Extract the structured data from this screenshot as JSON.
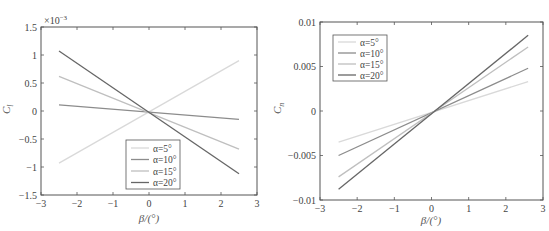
{
  "chart_data": [
    {
      "type": "line",
      "title": "",
      "xlabel": "β/(°)",
      "ylabel": "C_l",
      "y_multiplier_label": "×10⁻³",
      "xlim": [
        -3,
        3
      ],
      "ylim": [
        -1.5,
        1.5
      ],
      "xticks": [
        "-3",
        "-2",
        "-1",
        "0",
        "1",
        "2",
        "3"
      ],
      "yticks": [
        "-1.5",
        "-1",
        "-0.5",
        "0",
        "0.5",
        "1",
        "1.5"
      ],
      "grid": false,
      "legend_position": "lower center",
      "x": [
        -2.5,
        2.5
      ],
      "series": [
        {
          "name": "α=5°",
          "color": "#d9d9d9",
          "values": [
            -0.93,
            0.9
          ]
        },
        {
          "name": "α=10°",
          "color": "#8c8c8c",
          "values": [
            0.11,
            -0.15
          ]
        },
        {
          "name": "α=15°",
          "color": "#bfbfbf",
          "values": [
            0.62,
            -0.68
          ]
        },
        {
          "name": "α=20°",
          "color": "#666666",
          "values": [
            1.07,
            -1.12
          ]
        }
      ],
      "units_note": "values in units of 10^-3"
    },
    {
      "type": "line",
      "title": "",
      "xlabel": "β/(°)",
      "ylabel": "C_n",
      "xlim": [
        -3,
        3
      ],
      "ylim": [
        -0.01,
        0.01
      ],
      "xticks": [
        "-3",
        "-2",
        "-1",
        "0",
        "1",
        "2",
        "3"
      ],
      "yticks": [
        "-0.01",
        "-0.005",
        "0",
        "0.005",
        "0.01"
      ],
      "grid": false,
      "legend_position": "upper left",
      "x": [
        -2.5,
        2.6
      ],
      "series": [
        {
          "name": "α=5°",
          "color": "#d9d9d9",
          "values": [
            -0.0035,
            0.0033
          ]
        },
        {
          "name": "α=10°",
          "color": "#8c8c8c",
          "values": [
            -0.005,
            0.0048
          ]
        },
        {
          "name": "α=15°",
          "color": "#bfbfbf",
          "values": [
            -0.0074,
            0.0072
          ]
        },
        {
          "name": "α=20°",
          "color": "#666666",
          "values": [
            -0.0088,
            0.0085
          ]
        }
      ]
    }
  ],
  "left": {
    "ylabel": "C",
    "ylabel_sub": "l",
    "multiplier": "×10",
    "multiplier_exp": "−3",
    "xlabel": "β/(°)",
    "xticks": [
      "−3",
      "−2",
      "−1",
      "0",
      "1",
      "2",
      "3"
    ],
    "yticks": [
      "−1.5",
      "−1",
      "−0.5",
      "0",
      "0.5",
      "1",
      "1.5"
    ],
    "legend": [
      "α=5°",
      "α=10°",
      "α=15°",
      "α=20°"
    ]
  },
  "right": {
    "ylabel": "C",
    "ylabel_sub": "n",
    "xlabel": "β/(°)",
    "xticks": [
      "−3",
      "−2",
      "−1",
      "0",
      "1",
      "2",
      "3"
    ],
    "yticks": [
      "−0.01",
      "−0.005",
      "0",
      "0.005",
      "0.01"
    ],
    "legend": [
      "α=5°",
      "α=10°",
      "α=15°",
      "α=20°"
    ]
  }
}
